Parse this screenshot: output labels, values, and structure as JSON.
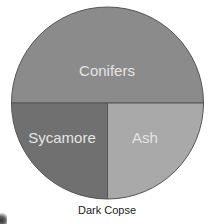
{
  "chart_data": {
    "type": "pie",
    "title": "Dark Copse",
    "categories": [
      "Conifers",
      "Sycamore",
      "Ash"
    ],
    "values": [
      50,
      25,
      25
    ],
    "colors": [
      "#8b8b8b",
      "#a9a9a9",
      "#707070"
    ],
    "legend": "none (labels inside slices)",
    "start_angle_deg": 180,
    "direction": "clockwise"
  },
  "labels": {
    "conifers": "Conifers",
    "sycamore": "Sycamore",
    "ash": "Ash",
    "title": "Dark Copse"
  }
}
